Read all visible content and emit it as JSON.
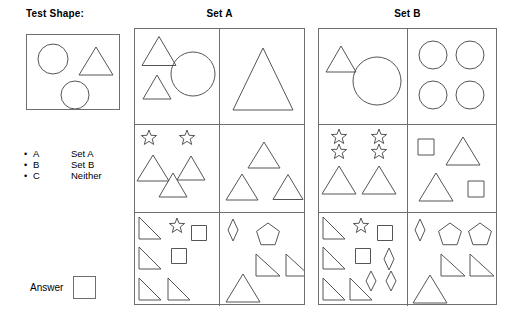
{
  "labels": {
    "test_shape_title": "Test Shape:",
    "set_a_title": "Set A",
    "set_b_title": "Set B",
    "answer_label": "Answer"
  },
  "legend": {
    "items": [
      {
        "bullet": "•",
        "key": "A",
        "value": "Set A"
      },
      {
        "bullet": "•",
        "key": "B",
        "value": "Set B"
      },
      {
        "bullet": "•",
        "key": "C",
        "value": "Neither"
      }
    ]
  },
  "answer": {
    "value": ""
  },
  "colors": {
    "stroke": "#555555",
    "border": "#6e6e6e",
    "text": "#000000",
    "background": "#ffffff"
  },
  "test_shape": {
    "shapes": [
      {
        "type": "circle",
        "cx": 26,
        "cy": 24,
        "r": 15
      },
      {
        "type": "triangle",
        "cx": 69,
        "cy": 26,
        "w": 34,
        "h": 28
      },
      {
        "type": "circle",
        "cx": 48,
        "cy": 60,
        "r": 14
      }
    ]
  },
  "set_a": {
    "cells": [
      {
        "id": "a-r1c1",
        "shapes": [
          {
            "type": "triangle",
            "cx": 24,
            "cy": 22,
            "w": 34,
            "h": 29
          },
          {
            "type": "triangle",
            "cx": 22,
            "cy": 58,
            "w": 28,
            "h": 24
          },
          {
            "type": "circle",
            "cx": 58,
            "cy": 45,
            "r": 22
          }
        ]
      },
      {
        "id": "a-r1c2",
        "shapes": [
          {
            "type": "triangle",
            "cx": 43,
            "cy": 50,
            "w": 60,
            "h": 62
          }
        ]
      },
      {
        "id": "a-r2c1",
        "shapes": [
          {
            "type": "star",
            "cx": 14,
            "cy": 13,
            "r": 8
          },
          {
            "type": "star",
            "cx": 52,
            "cy": 13,
            "r": 8
          },
          {
            "type": "triangle",
            "cx": 18,
            "cy": 43,
            "w": 32,
            "h": 26
          },
          {
            "type": "triangle",
            "cx": 56,
            "cy": 43,
            "w": 28,
            "h": 24
          },
          {
            "type": "triangle",
            "cx": 38,
            "cy": 60,
            "w": 28,
            "h": 24
          }
        ]
      },
      {
        "id": "a-r2c2",
        "shapes": [
          {
            "type": "triangle",
            "cx": 44,
            "cy": 30,
            "w": 32,
            "h": 26
          },
          {
            "type": "triangle",
            "cx": 22,
            "cy": 62,
            "w": 32,
            "h": 26
          },
          {
            "type": "triangle",
            "cx": 68,
            "cy": 62,
            "w": 30,
            "h": 25
          }
        ]
      },
      {
        "id": "a-r3c1",
        "shapes": [
          {
            "type": "right-triangle",
            "cx": 15,
            "cy": 15,
            "w": 22,
            "h": 22
          },
          {
            "type": "star",
            "cx": 42,
            "cy": 13,
            "r": 8
          },
          {
            "type": "square",
            "cx": 64,
            "cy": 20,
            "s": 15
          },
          {
            "type": "right-triangle",
            "cx": 15,
            "cy": 45,
            "w": 22,
            "h": 22
          },
          {
            "type": "square",
            "cx": 44,
            "cy": 43,
            "s": 15
          },
          {
            "type": "right-triangle",
            "cx": 15,
            "cy": 76,
            "w": 22,
            "h": 22
          },
          {
            "type": "right-triangle",
            "cx": 44,
            "cy": 76,
            "w": 22,
            "h": 22
          }
        ]
      },
      {
        "id": "a-r3c2",
        "shapes": [
          {
            "type": "diamond",
            "cx": 13,
            "cy": 17,
            "w": 10,
            "h": 22
          },
          {
            "type": "pentagon",
            "cx": 48,
            "cy": 22,
            "r": 12
          },
          {
            "type": "right-triangle",
            "cx": 48,
            "cy": 52,
            "w": 24,
            "h": 22
          },
          {
            "type": "right-triangle",
            "cx": 78,
            "cy": 52,
            "w": 24,
            "h": 22
          },
          {
            "type": "triangle",
            "cx": 23,
            "cy": 75,
            "w": 34,
            "h": 28
          }
        ]
      }
    ]
  },
  "set_b": {
    "cells": [
      {
        "id": "b-r1c1",
        "shapes": [
          {
            "type": "triangle",
            "cx": 22,
            "cy": 30,
            "w": 30,
            "h": 26
          },
          {
            "type": "circle",
            "cx": 58,
            "cy": 52,
            "r": 24
          }
        ]
      },
      {
        "id": "b-r1c2",
        "shapes": [
          {
            "type": "circle",
            "cx": 25,
            "cy": 26,
            "r": 14
          },
          {
            "type": "circle",
            "cx": 62,
            "cy": 26,
            "r": 14
          },
          {
            "type": "circle",
            "cx": 25,
            "cy": 66,
            "r": 14
          },
          {
            "type": "circle",
            "cx": 62,
            "cy": 66,
            "r": 14
          }
        ]
      },
      {
        "id": "b-r2c1",
        "shapes": [
          {
            "type": "star",
            "cx": 20,
            "cy": 12,
            "r": 8
          },
          {
            "type": "star",
            "cx": 20,
            "cy": 27,
            "r": 8
          },
          {
            "type": "star",
            "cx": 60,
            "cy": 12,
            "r": 8
          },
          {
            "type": "star",
            "cx": 60,
            "cy": 27,
            "r": 8
          },
          {
            "type": "triangle",
            "cx": 20,
            "cy": 55,
            "w": 34,
            "h": 28
          },
          {
            "type": "triangle",
            "cx": 60,
            "cy": 55,
            "w": 34,
            "h": 28
          }
        ]
      },
      {
        "id": "b-r2c2",
        "shapes": [
          {
            "type": "square",
            "cx": 18,
            "cy": 22,
            "s": 16
          },
          {
            "type": "triangle",
            "cx": 55,
            "cy": 26,
            "w": 34,
            "h": 28
          },
          {
            "type": "triangle",
            "cx": 28,
            "cy": 62,
            "w": 34,
            "h": 28
          },
          {
            "type": "square",
            "cx": 68,
            "cy": 64,
            "s": 16
          }
        ]
      },
      {
        "id": "b-r3c1",
        "shapes": [
          {
            "type": "right-triangle",
            "cx": 15,
            "cy": 15,
            "w": 22,
            "h": 22
          },
          {
            "type": "star",
            "cx": 42,
            "cy": 13,
            "r": 8
          },
          {
            "type": "square",
            "cx": 66,
            "cy": 20,
            "s": 15
          },
          {
            "type": "right-triangle",
            "cx": 15,
            "cy": 45,
            "w": 22,
            "h": 22
          },
          {
            "type": "square",
            "cx": 44,
            "cy": 43,
            "s": 15
          },
          {
            "type": "diamond",
            "cx": 70,
            "cy": 46,
            "w": 10,
            "h": 22
          },
          {
            "type": "diamond",
            "cx": 52,
            "cy": 68,
            "w": 10,
            "h": 20
          },
          {
            "type": "diamond",
            "cx": 72,
            "cy": 68,
            "w": 10,
            "h": 20
          },
          {
            "type": "right-triangle",
            "cx": 15,
            "cy": 76,
            "w": 22,
            "h": 22
          },
          {
            "type": "right-triangle",
            "cx": 42,
            "cy": 76,
            "w": 22,
            "h": 22
          }
        ]
      },
      {
        "id": "b-r3c2",
        "shapes": [
          {
            "type": "diamond",
            "cx": 12,
            "cy": 17,
            "w": 10,
            "h": 22
          },
          {
            "type": "pentagon",
            "cx": 42,
            "cy": 22,
            "r": 12
          },
          {
            "type": "pentagon",
            "cx": 72,
            "cy": 22,
            "r": 12
          },
          {
            "type": "right-triangle",
            "cx": 45,
            "cy": 52,
            "w": 24,
            "h": 22
          },
          {
            "type": "right-triangle",
            "cx": 74,
            "cy": 52,
            "w": 24,
            "h": 22
          },
          {
            "type": "triangle",
            "cx": 22,
            "cy": 76,
            "w": 34,
            "h": 28
          }
        ]
      }
    ]
  }
}
